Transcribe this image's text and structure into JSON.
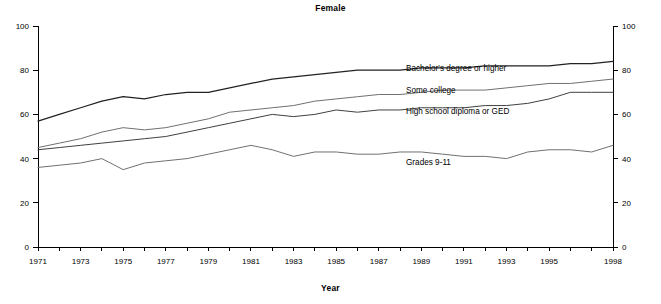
{
  "chart_data": {
    "type": "line",
    "title": "Female",
    "xlabel": "Year",
    "ylabel": "",
    "xlim": [
      1971,
      1998
    ],
    "ylim": [
      0,
      100
    ],
    "grid": false,
    "legend_position": "inline-right",
    "y_ticks": [
      0,
      20,
      40,
      60,
      80,
      100
    ],
    "y_ticks_right": [
      0,
      20,
      40,
      60,
      80,
      100
    ],
    "x_tick_labels": [
      "1971",
      "1973",
      "1975",
      "1977",
      "1979",
      "1981",
      "1983",
      "1985",
      "1987",
      "1989",
      "1991",
      "1993",
      "1995",
      "1998"
    ],
    "x": [
      1971,
      1972,
      1973,
      1974,
      1975,
      1976,
      1977,
      1978,
      1979,
      1980,
      1981,
      1982,
      1983,
      1984,
      1985,
      1986,
      1987,
      1988,
      1989,
      1990,
      1991,
      1992,
      1993,
      1994,
      1995,
      1996,
      1997,
      1998
    ],
    "series": [
      {
        "name": "Bachelor's degree or higher",
        "label": "Bachelor's degree or higher",
        "color": "#222222",
        "values": [
          57,
          60,
          63,
          66,
          68,
          67,
          69,
          70,
          70,
          72,
          74,
          76,
          77,
          78,
          79,
          80,
          80,
          80,
          81,
          81,
          81,
          82,
          82,
          82,
          82,
          83,
          83,
          84
        ]
      },
      {
        "name": "Some college",
        "label": "Some college",
        "color": "#707070",
        "values": [
          45,
          47,
          49,
          52,
          54,
          53,
          54,
          56,
          58,
          61,
          62,
          63,
          64,
          66,
          67,
          68,
          69,
          69,
          70,
          71,
          71,
          71,
          72,
          73,
          74,
          74,
          75,
          76
        ]
      },
      {
        "name": "High school diploma or GED",
        "label": "High school diploma or GED",
        "color": "#404040",
        "values": [
          44,
          45,
          46,
          47,
          48,
          49,
          50,
          52,
          54,
          56,
          58,
          60,
          59,
          60,
          62,
          61,
          62,
          62,
          63,
          63,
          63,
          64,
          64,
          65,
          67,
          70,
          70,
          70
        ]
      },
      {
        "name": "Grades 9-11",
        "label": "Grades 9-11",
        "color": "#707070",
        "values": [
          36,
          37,
          38,
          40,
          35,
          38,
          39,
          40,
          42,
          44,
          46,
          44,
          41,
          43,
          43,
          42,
          42,
          43,
          43,
          42,
          41,
          41,
          40,
          43,
          44,
          44,
          43,
          46
        ]
      }
    ],
    "label_anchors": [
      {
        "series": "Bachelor's degree or higher",
        "x_px": 406,
        "y_px": 71
      },
      {
        "series": "Some college",
        "x_px": 406,
        "y_px": 93
      },
      {
        "series": "High school diploma or GED",
        "x_px": 406,
        "y_px": 114
      },
      {
        "series": "Grades 9-11",
        "x_px": 406,
        "y_px": 165
      }
    ]
  }
}
